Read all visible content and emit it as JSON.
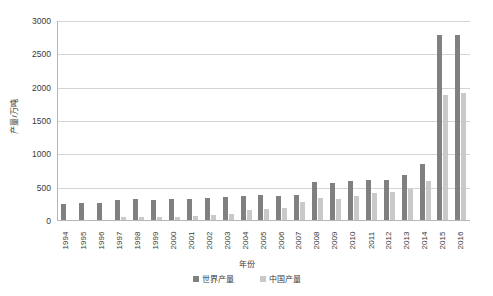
{
  "chart_data": {
    "type": "bar",
    "title": "",
    "subtitle": "",
    "xlabel": "年份",
    "ylabel": "产量/万吨",
    "ylim": [
      0,
      3000
    ],
    "ytick_step": 500,
    "yticks": [
      "0",
      "500",
      "1000",
      "1500",
      "2000",
      "2500",
      "3000"
    ],
    "grid": true,
    "legend_position": "bottom",
    "categories": [
      "1994",
      "1995",
      "1996",
      "1997",
      "1998",
      "1999",
      "2000",
      "2001",
      "2002",
      "2003",
      "2004",
      "2005",
      "2006",
      "2007",
      "2008",
      "2009",
      "2010",
      "2011",
      "2012",
      "2013",
      "2014",
      "2015",
      "2016"
    ],
    "series": [
      {
        "name": "世界产量",
        "color": "#808080",
        "values": [
          240,
          255,
          250,
          305,
          310,
          305,
          310,
          310,
          330,
          340,
          355,
          375,
          355,
          370,
          565,
          560,
          585,
          595,
          605,
          670,
          840,
          2780,
          2775
        ]
      },
      {
        "name": "中国产量",
        "color": "#c9c9c9",
        "values": [
          0,
          0,
          0,
          40,
          45,
          50,
          50,
          55,
          80,
          90,
          155,
          165,
          185,
          265,
          330,
          320,
          355,
          410,
          420,
          460,
          580,
          1880,
          1900
        ]
      }
    ]
  },
  "legend": {
    "items": [
      {
        "label": "世界产量",
        "color": "#808080"
      },
      {
        "label": "中国产量",
        "color": "#c9c9c9"
      }
    ]
  },
  "axes": {
    "y_title": "产量/万吨",
    "x_title": "年份"
  },
  "colors": {
    "background": "#ffffff",
    "gridline": "#d4d4d4",
    "axis_line": "#b6b6b6",
    "text": "#3a3a3a",
    "series_world": "#808080",
    "series_china": "#c9c9c9"
  }
}
